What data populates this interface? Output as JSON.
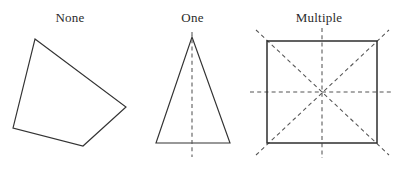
{
  "figure": {
    "background_color": "#ffffff",
    "stroke_color": "#333333",
    "dash_color": "#555555",
    "label_color": "#2b2b2b",
    "width": 393,
    "height": 170
  },
  "panels": [
    {
      "id": "none",
      "label": "None",
      "shape": "irregular-quadrilateral",
      "symmetry_line_count": 0,
      "vertices": "35,39 126,107 83,146 13,128"
    },
    {
      "id": "one",
      "label": "One",
      "shape": "isosceles-triangle",
      "symmetry_line_count": 1,
      "vertices": "192,37 230,143 156,143",
      "axes": [
        {
          "name": "vertical-axis",
          "x1": 192,
          "y1": 32,
          "x2": 192,
          "y2": 157
        }
      ]
    },
    {
      "id": "multiple",
      "label": "Multiple",
      "shape": "square",
      "symmetry_line_count": 4,
      "square": {
        "x": 267,
        "y": 41,
        "width": 110,
        "height": 102
      },
      "axes": [
        {
          "name": "vertical-axis",
          "x1": 322,
          "y1": 28,
          "x2": 322,
          "y2": 158
        },
        {
          "name": "horizontal-axis",
          "x1": 250,
          "y1": 92,
          "x2": 393,
          "y2": 92
        },
        {
          "name": "diagonal-axis-tlbr",
          "x1": 256,
          "y1": 30,
          "x2": 389,
          "y2": 155
        },
        {
          "name": "diagonal-axis-bltr",
          "x1": 256,
          "y1": 155,
          "x2": 389,
          "y2": 30
        }
      ]
    }
  ]
}
